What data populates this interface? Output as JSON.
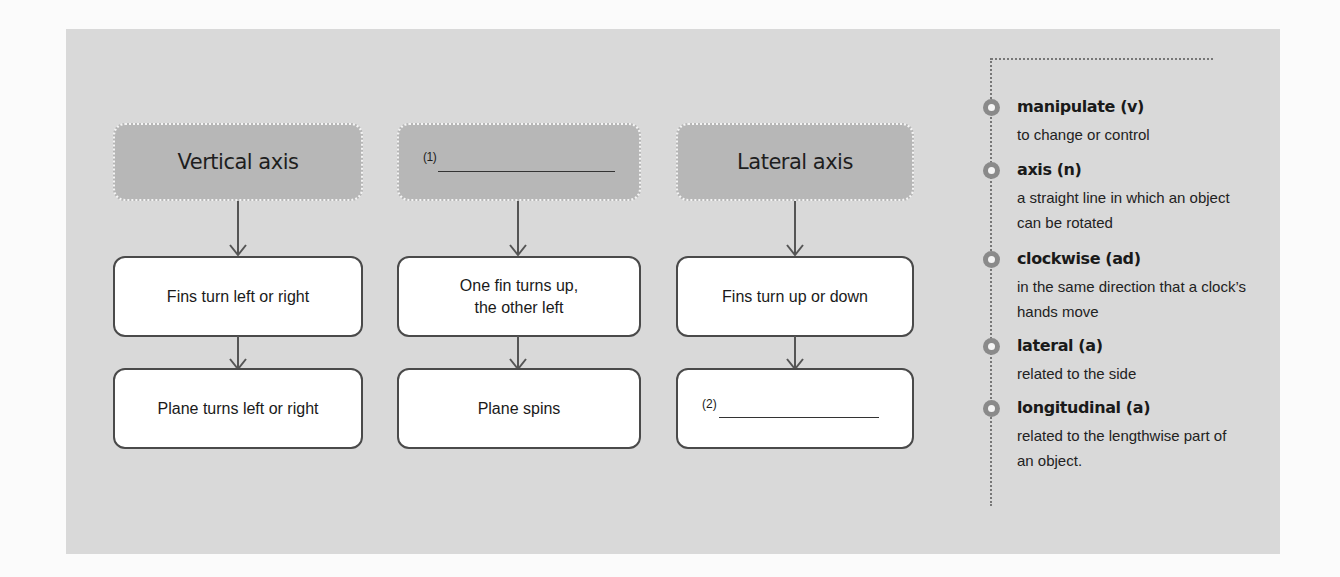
{
  "diagram": {
    "columns": [
      {
        "header": "Vertical axis",
        "header_blank": false,
        "step1": "Fins turn left or right",
        "step2": "Plane turns left or right",
        "step2_blank": false
      },
      {
        "header": "",
        "header_blank": true,
        "header_blank_number": "(1)",
        "step1_line1": "One fin turns up,",
        "step1_line2": "the other left",
        "step2": "Plane spins",
        "step2_blank": false
      },
      {
        "header": "Lateral axis",
        "header_blank": false,
        "step1": "Fins turn up or down",
        "step2": "",
        "step2_blank": true,
        "step2_blank_number": "(2)"
      }
    ]
  },
  "glossary": {
    "items": [
      {
        "term": "manipulate (v)",
        "definition": "to change or control"
      },
      {
        "term": "axis (n)",
        "definition": "a straight line in which an object can be rotated"
      },
      {
        "term": "clockwise (ad)",
        "definition": "in the same direction that a clock’s hands move"
      },
      {
        "term": "lateral (a)",
        "definition": "related to the side"
      },
      {
        "term": "longitudinal (a)",
        "definition": "related to the lengthwise part of an object."
      }
    ]
  },
  "colors": {
    "panel": "#d9d9d9",
    "header_box": "#b7b7b7",
    "box_border": "#4a4a4a",
    "bullet": "#8a8a8a"
  }
}
